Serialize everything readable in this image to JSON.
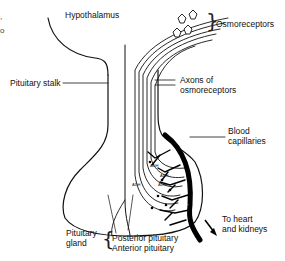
{
  "diagram": {
    "labels": {
      "hypothalamus": "Hypothalamus",
      "osmoreceptors": "Osmoreceptors",
      "pituitary_stalk": "Pituitary stalk",
      "axons_line1": "Axons of",
      "axons_line2": "osmoreceptors",
      "blood_line1": "Blood",
      "blood_line2": "capillaries",
      "heart_line1": "To heart",
      "heart_line2": "and kidneys",
      "gland_line1": "Pituitary",
      "gland_line2": "gland",
      "posterior": "Posterior pituitary",
      "anterior": "Anterior pituitary"
    },
    "hormone_tags": [
      "ADH",
      "ADH",
      "ADH",
      "ADH"
    ],
    "edge_fragments": [
      ",",
      "o"
    ],
    "colors": {
      "ink": "#111111",
      "background": "#ffffff"
    }
  }
}
